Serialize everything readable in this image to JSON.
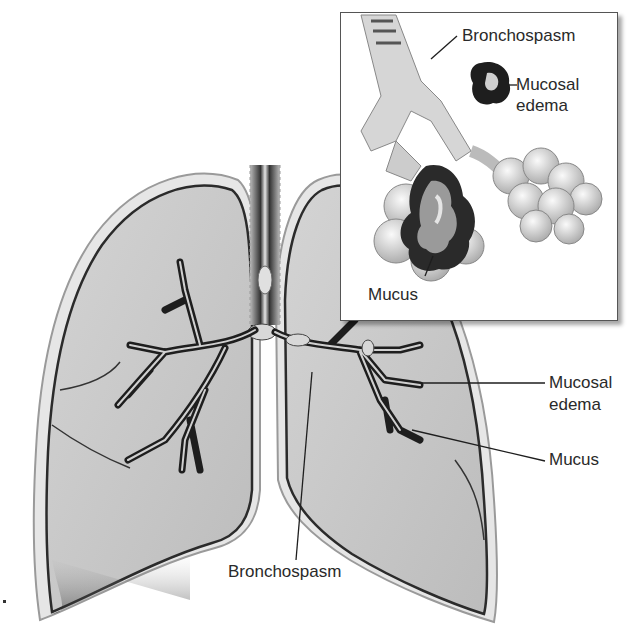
{
  "figure": {
    "type": "anatomical-illustration",
    "colors": {
      "background": "#ffffff",
      "lung_fill": "#c9c9c9",
      "lung_outline": "#2b2b2b",
      "airway_dark": "#1e1e1e",
      "label_text": "#2a2a2a",
      "inset_border": "#555555"
    }
  },
  "main_labels": {
    "mucosal_edema": "Mucosal\nedema",
    "mucosal_edema_line1": "Mucosal",
    "mucosal_edema_line2": "edema",
    "mucus": "Mucus",
    "bronchospasm": "Bronchospasm"
  },
  "inset": {
    "labels": {
      "bronchospasm": "Bronchospasm",
      "mucosal_edema_line1": "Mucosal",
      "mucosal_edema_line2": "edema",
      "mucus": "Mucus"
    }
  }
}
